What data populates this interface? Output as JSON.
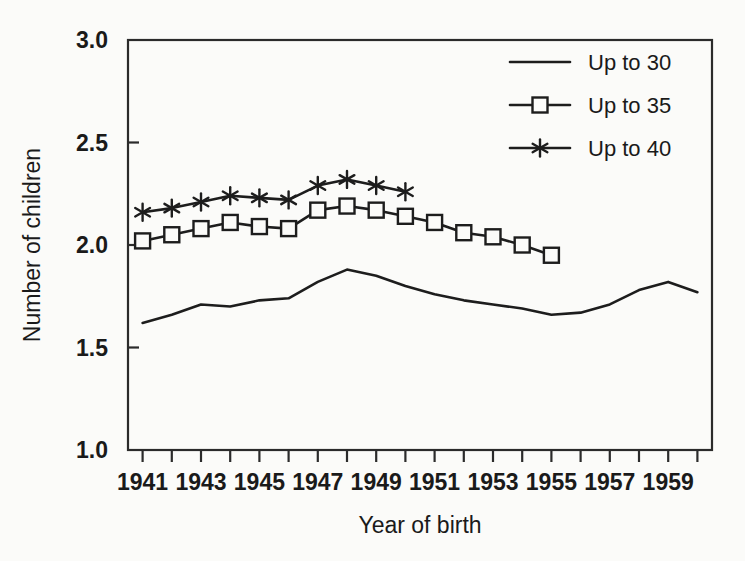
{
  "chart_data": {
    "type": "line",
    "title": "",
    "xlabel": "Year of birth",
    "ylabel": "Number of children",
    "xlim": [
      1940.5,
      1960.5
    ],
    "ylim": [
      1.0,
      3.0
    ],
    "grid": false,
    "legend_position": "top-right",
    "x_tick_values": [
      1941,
      1942,
      1943,
      1944,
      1945,
      1946,
      1947,
      1948,
      1949,
      1950,
      1951,
      1952,
      1953,
      1954,
      1955,
      1956,
      1957,
      1958,
      1959,
      1960
    ],
    "x_tick_labels": [
      "1941",
      "",
      "1943",
      "",
      "1945",
      "",
      "1947",
      "",
      "1949",
      "",
      "1951",
      "",
      "1953",
      "",
      "1955",
      "",
      "1957",
      "",
      "1959",
      ""
    ],
    "x_labelled_ticks": [
      "1941",
      "1943",
      "1945",
      "1947",
      "1949",
      "1951",
      "1953",
      "1955",
      "1957",
      "1959"
    ],
    "y_tick_values": [
      1.0,
      1.5,
      2.0,
      2.5,
      3.0
    ],
    "y_tick_labels": [
      "1.0",
      "1.5",
      "2.0",
      "2.5",
      "3.0"
    ],
    "series": [
      {
        "name": "Up to 30",
        "marker": "none",
        "x": [
          1941,
          1942,
          1943,
          1944,
          1945,
          1946,
          1947,
          1948,
          1949,
          1950,
          1951,
          1952,
          1953,
          1954,
          1955,
          1956,
          1957,
          1958,
          1959,
          1960
        ],
        "values": [
          1.62,
          1.66,
          1.71,
          1.7,
          1.73,
          1.74,
          1.82,
          1.88,
          1.85,
          1.8,
          1.76,
          1.73,
          1.71,
          1.69,
          1.66,
          1.67,
          1.71,
          1.78,
          1.82,
          1.77
        ]
      },
      {
        "name": "Up to 35",
        "marker": "square",
        "x": [
          1941,
          1942,
          1943,
          1944,
          1945,
          1946,
          1947,
          1948,
          1949,
          1950,
          1951,
          1952,
          1953,
          1954,
          1955
        ],
        "values": [
          2.02,
          2.05,
          2.08,
          2.11,
          2.09,
          2.08,
          2.17,
          2.19,
          2.17,
          2.14,
          2.11,
          2.06,
          2.04,
          2.0,
          1.95
        ]
      },
      {
        "name": "Up to 40",
        "marker": "star",
        "x": [
          1941,
          1942,
          1943,
          1944,
          1945,
          1946,
          1947,
          1948,
          1949,
          1950
        ],
        "values": [
          2.16,
          2.18,
          2.21,
          2.24,
          2.23,
          2.22,
          2.29,
          2.32,
          2.29,
          2.26
        ]
      }
    ],
    "legend": [
      {
        "label": "Up to 30",
        "marker": "none"
      },
      {
        "label": "Up to 35",
        "marker": "square"
      },
      {
        "label": "Up to 40",
        "marker": "star"
      }
    ]
  },
  "colors": {
    "line": "#1d1d1d",
    "axis": "#2b2b2b",
    "text": "#1a1a1a",
    "background": "#fbfbf9"
  }
}
